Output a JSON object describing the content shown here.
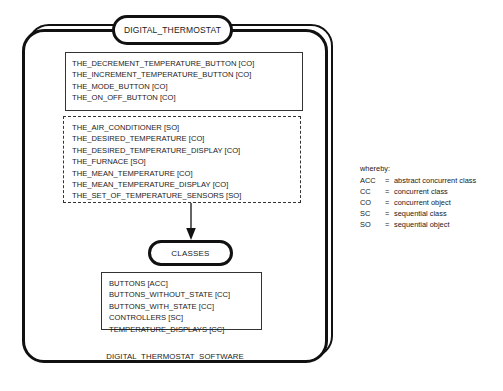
{
  "diagram": {
    "title": "DIGITAL_THERMOSTAT",
    "bottom_caption": "DIGITAL_THERMOSTAT_SOFTWARE",
    "classes_tab_label": "CLASSES",
    "objects_solid": [
      "THE_DECREMENT_TEMPERATURE_BUTTON [CO]",
      "THE_INCREMENT_TEMPERATURE_BUTTON [CO]",
      "THE_MODE_BUTTON [CO]",
      "THE_ON_OFF_BUTTON [CO]"
    ],
    "objects_dashed": [
      "THE_AIR_CONDITIONER [SO]",
      "THE_DESIRED_TEMPERATURE [CO]",
      "THE_DESIRED_TEMPERATURE_DISPLAY [CO]",
      "THE_FURNACE [SO]",
      "THE_MEAN_TEMPERATURE [CO]",
      "THE_MEAN_TEMPERATURE_DISPLAY [CO]",
      "THE_SET_OF_TEMPERATURE_SENSORS [SO]"
    ],
    "classes_list": [
      "BUTTONS [ACC]",
      "BUTTONS_WITHOUT_STATE [CC]",
      "BUTTONS_WITH_STATE [CC]",
      "CONTROLLERS [SC]",
      "TEMPERATURE_DISPLAYS [CC]"
    ]
  },
  "legend": {
    "heading": "whereby:",
    "entries": [
      {
        "abbr": "ACC",
        "eq": "=",
        "desc": "abstract concurrent class"
      },
      {
        "abbr": "CC",
        "eq": "=",
        "desc": "concurrent class"
      },
      {
        "abbr": "CO",
        "eq": "=",
        "desc": "concurrent object"
      },
      {
        "abbr": "SC",
        "eq": "=",
        "desc": "sequential class"
      },
      {
        "abbr": "SO",
        "eq": "=",
        "desc": "sequential object"
      }
    ]
  },
  "colors": {
    "stroke": "#111111",
    "inner_stroke": "#333333",
    "background": "#ffffff"
  }
}
